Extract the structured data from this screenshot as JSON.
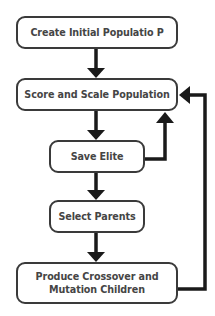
{
  "diagram": {
    "type": "flowchart",
    "colors": {
      "stroke": "#1a1a1a",
      "box_border": "#3a3a3a",
      "text": "#454545",
      "background": "#ffffff"
    },
    "nodes": [
      {
        "id": "create",
        "label": "Create Initial Populatio P"
      },
      {
        "id": "score",
        "label": "Score and Scale Population"
      },
      {
        "id": "elite",
        "label": "Save Elite"
      },
      {
        "id": "select",
        "label": "Select Parents"
      },
      {
        "id": "produce",
        "label_line1": "Produce Crossover and",
        "label_line2": "Mutation Children"
      }
    ],
    "edges": [
      {
        "from": "create",
        "to": "score"
      },
      {
        "from": "score",
        "to": "elite"
      },
      {
        "from": "elite",
        "to": "select"
      },
      {
        "from": "select",
        "to": "produce"
      },
      {
        "from": "elite",
        "to": "score",
        "route": "right-loop"
      },
      {
        "from": "produce",
        "to": "score",
        "route": "outer-right-loop"
      }
    ]
  }
}
